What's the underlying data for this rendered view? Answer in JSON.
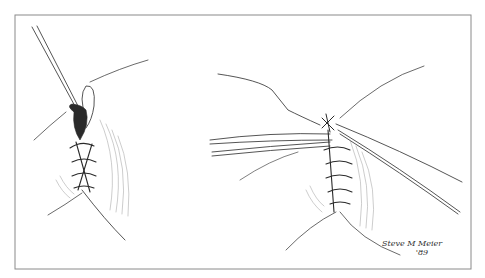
{
  "illustration": {
    "subject": "Surgical suture illustration: running/interlocking suture closure shown in two panels",
    "panels": [
      {
        "id": "left",
        "description": "Needle and thread passing through wound edge with sutures placed below"
      },
      {
        "id": "right",
        "description": "Completed suture line being tied with forceps and needle holder"
      }
    ],
    "signature": {
      "name": "Steve M Meier",
      "year": "'89"
    },
    "colors": {
      "line": "#2a2a2a",
      "frame": "#8a8a8a",
      "background": "#ffffff"
    }
  }
}
